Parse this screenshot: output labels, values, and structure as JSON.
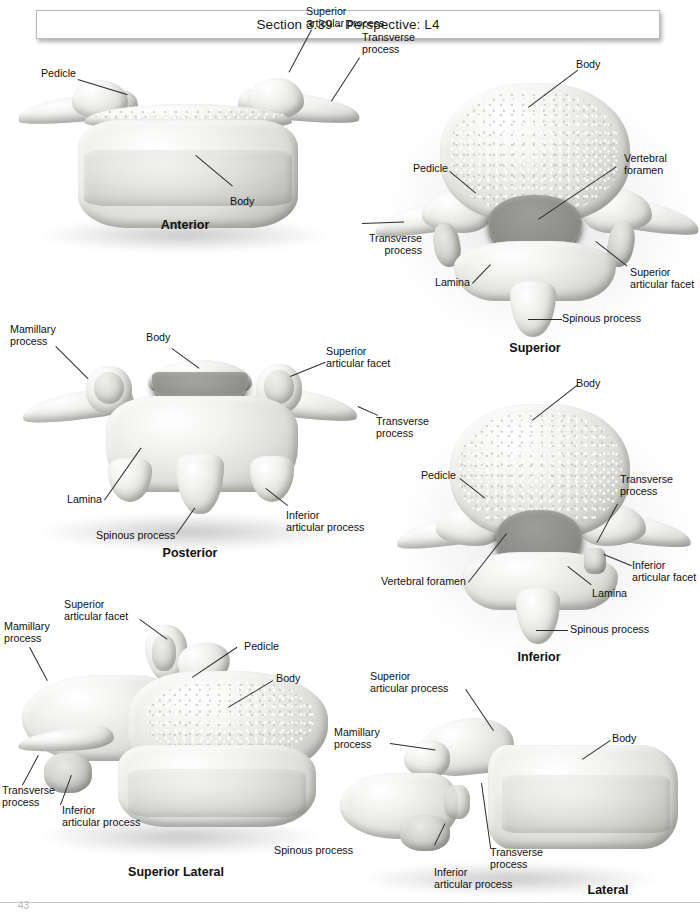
{
  "header": {
    "title": "Section 3.39 - Perspective: L4"
  },
  "page_number": "43",
  "views": [
    {
      "id": "anterior",
      "caption": "Anterior",
      "labels": [
        {
          "text": "Pedicle"
        },
        {
          "text": "Superior\narticular process"
        },
        {
          "text": "Transverse\nprocess"
        },
        {
          "text": "Body"
        }
      ]
    },
    {
      "id": "superior",
      "caption": "Superior",
      "labels": [
        {
          "text": "Body"
        },
        {
          "text": "Vertebral\nforamen"
        },
        {
          "text": "Pedicle"
        },
        {
          "text": "Transverse\nprocess"
        },
        {
          "text": "Lamina"
        },
        {
          "text": "Superior\narticular facet"
        },
        {
          "text": "Spinous process"
        }
      ]
    },
    {
      "id": "posterior",
      "caption": "Posterior",
      "labels": [
        {
          "text": "Mamillary\nprocess"
        },
        {
          "text": "Body"
        },
        {
          "text": "Superior\narticular facet"
        },
        {
          "text": "Transverse\nprocess"
        },
        {
          "text": "Lamina"
        },
        {
          "text": "Spinous process"
        },
        {
          "text": "Inferior\narticular process"
        }
      ]
    },
    {
      "id": "inferior",
      "caption": "Inferior",
      "labels": [
        {
          "text": "Body"
        },
        {
          "text": "Pedicle"
        },
        {
          "text": "Transverse\nprocess"
        },
        {
          "text": "Vertebral foramen"
        },
        {
          "text": "Lamina"
        },
        {
          "text": "Inferior\narticular facet"
        },
        {
          "text": "Spinous process"
        }
      ]
    },
    {
      "id": "superior-lateral",
      "caption": "Superior Lateral",
      "labels": [
        {
          "text": "Superior\narticular facet"
        },
        {
          "text": "Mamillary\nprocess"
        },
        {
          "text": "Pedicle"
        },
        {
          "text": "Body"
        },
        {
          "text": "Transverse\nprocess"
        },
        {
          "text": "Inferior\narticular process"
        },
        {
          "text": "Spinous process"
        }
      ]
    },
    {
      "id": "lateral",
      "caption": "Lateral",
      "labels": [
        {
          "text": "Superior\narticular process"
        },
        {
          "text": "Mamillary\nprocess"
        },
        {
          "text": "Body"
        },
        {
          "text": "Transverse\nprocess"
        },
        {
          "text": "Inferior\narticular process"
        }
      ]
    }
  ],
  "colors": {
    "page_background": "#ffffff",
    "text": "#111111",
    "leader_line": "#2b2b2b",
    "bone_light": "#f2f2f0",
    "bone_mid": "#d4d4d0",
    "bone_shadow": "#949490",
    "foramen": "#8e8e8a",
    "header_border": "#b9b9b9"
  }
}
